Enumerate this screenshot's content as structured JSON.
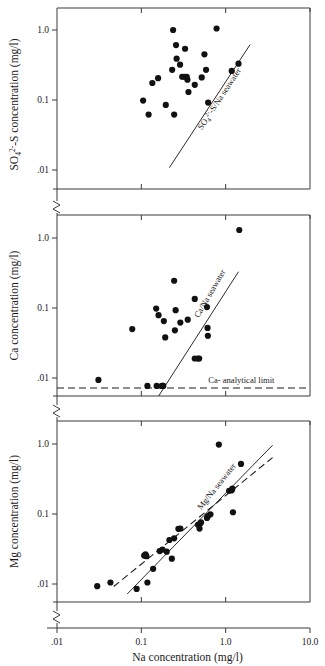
{
  "figure": {
    "xaxis": {
      "label": "Na concentration (mg/l)",
      "ticks": [
        ".01",
        "0.1",
        "1.0",
        "10.0"
      ],
      "tickvalues": [
        0.01,
        0.1,
        1.0,
        10.0
      ],
      "range": [
        0.01,
        10.0
      ],
      "scale": "log"
    },
    "panels": [
      {
        "id": "so4",
        "ylabel": "SO₄²⁻-S concentration (mg/l)",
        "ylabel_parts": {
          "base": "SO",
          "sub": "4",
          "sup": "2-",
          "rest": "-S concentration (mg/l)"
        },
        "yticks": [
          "1.0",
          "0.1",
          ".01"
        ],
        "ytickvalues": [
          1.0,
          0.1,
          0.01
        ],
        "yrange": [
          0.01,
          1.6
        ],
        "axis_break": true,
        "annotations": [
          {
            "text": "SO₄²⁻-S/Na seawater",
            "kind": "reference-line-label",
            "rotated": true
          }
        ]
      },
      {
        "id": "ca",
        "ylabel": "Ca concentration (mg/l)",
        "yticks": [
          "1.0",
          "0.1",
          ".01"
        ],
        "ytickvalues": [
          1.0,
          0.1,
          0.01
        ],
        "yrange": [
          0.006,
          2.2
        ],
        "axis_break": true,
        "annotations": [
          {
            "text": "Ca/Na seawater",
            "kind": "reference-line-label",
            "rotated": true
          },
          {
            "text": "Ca- analytical limit",
            "kind": "dashed-limit-label",
            "rotated": false
          }
        ]
      },
      {
        "id": "mg",
        "ylabel": "Mg concentration (mg/l)",
        "yticks": [
          "1.0",
          "0.1",
          ".01"
        ],
        "ytickvalues": [
          1.0,
          0.1,
          0.01
        ],
        "yrange": [
          0.007,
          2.2
        ],
        "axis_break": true,
        "annotations": [
          {
            "text": "Mg/Na seawater",
            "kind": "reference-line-label",
            "rotated": true
          }
        ]
      }
    ]
  },
  "chart_data": [
    {
      "type": "scatter",
      "id": "so4-vs-na",
      "title": "",
      "xlabel": "Na concentration (mg/l)",
      "ylabel": "SO4(2-)-S concentration (mg/l)",
      "xscale": "log",
      "yscale": "log",
      "xlim": [
        0.01,
        10.0
      ],
      "ylim": [
        0.01,
        1.6
      ],
      "grid": false,
      "legend": false,
      "marker": "filled-circle",
      "points": [
        {
          "x": 0.105,
          "y": 0.098
        },
        {
          "x": 0.122,
          "y": 0.062
        },
        {
          "x": 0.135,
          "y": 0.175
        },
        {
          "x": 0.158,
          "y": 0.205
        },
        {
          "x": 0.195,
          "y": 0.085
        },
        {
          "x": 0.232,
          "y": 0.27
        },
        {
          "x": 0.238,
          "y": 1.0
        },
        {
          "x": 0.245,
          "y": 0.062
        },
        {
          "x": 0.258,
          "y": 0.61
        },
        {
          "x": 0.262,
          "y": 0.39
        },
        {
          "x": 0.288,
          "y": 0.32
        },
        {
          "x": 0.305,
          "y": 0.215
        },
        {
          "x": 0.322,
          "y": 0.215
        },
        {
          "x": 0.33,
          "y": 0.54
        },
        {
          "x": 0.345,
          "y": 0.215
        },
        {
          "x": 0.352,
          "y": 0.195
        },
        {
          "x": 0.362,
          "y": 0.13
        },
        {
          "x": 0.43,
          "y": 0.165
        },
        {
          "x": 0.52,
          "y": 0.21
        },
        {
          "x": 0.56,
          "y": 0.45
        },
        {
          "x": 0.585,
          "y": 0.27
        },
        {
          "x": 0.62,
          "y": 0.092
        },
        {
          "x": 0.78,
          "y": 1.05
        },
        {
          "x": 1.18,
          "y": 0.26
        },
        {
          "x": 1.42,
          "y": 0.33
        }
      ],
      "reference_lines": [
        {
          "name": "SO4(2-)-S/Na seawater",
          "style": "solid",
          "x": [
            0.215,
            1.95
          ],
          "y": [
            0.0108,
            0.62
          ]
        }
      ]
    },
    {
      "type": "scatter",
      "id": "ca-vs-na",
      "title": "",
      "xlabel": "Na concentration (mg/l)",
      "ylabel": "Ca concentration (mg/l)",
      "xscale": "log",
      "yscale": "log",
      "xlim": [
        0.01,
        10.0
      ],
      "ylim": [
        0.006,
        2.2
      ],
      "grid": false,
      "legend": false,
      "marker": "filled-circle",
      "points": [
        {
          "x": 0.031,
          "y": 0.0094
        },
        {
          "x": 0.078,
          "y": 0.05
        },
        {
          "x": 0.118,
          "y": 0.0077
        },
        {
          "x": 0.15,
          "y": 0.098
        },
        {
          "x": 0.152,
          "y": 0.0077
        },
        {
          "x": 0.16,
          "y": 0.079
        },
        {
          "x": 0.175,
          "y": 0.0077
        },
        {
          "x": 0.18,
          "y": 0.0077
        },
        {
          "x": 0.182,
          "y": 0.0077
        },
        {
          "x": 0.185,
          "y": 0.065
        },
        {
          "x": 0.192,
          "y": 0.038
        },
        {
          "x": 0.245,
          "y": 0.245
        },
        {
          "x": 0.25,
          "y": 0.048
        },
        {
          "x": 0.255,
          "y": 0.093
        },
        {
          "x": 0.29,
          "y": 0.062
        },
        {
          "x": 0.355,
          "y": 0.068
        },
        {
          "x": 0.43,
          "y": 0.019
        },
        {
          "x": 0.47,
          "y": 0.019
        },
        {
          "x": 0.485,
          "y": 0.019
        },
        {
          "x": 0.43,
          "y": 0.135
        },
        {
          "x": 0.6,
          "y": 0.103
        },
        {
          "x": 0.61,
          "y": 0.052
        },
        {
          "x": 0.615,
          "y": 0.04
        },
        {
          "x": 1.45,
          "y": 1.3
        }
      ],
      "reference_lines": [
        {
          "name": "Ca/Na seawater",
          "style": "solid",
          "x": [
            0.16,
            1.42
          ],
          "y": [
            0.0055,
            0.33
          ]
        },
        {
          "name": "Ca- analytical limit",
          "style": "dashed",
          "horizontal": true,
          "y": 0.0072
        }
      ]
    },
    {
      "type": "scatter",
      "id": "mg-vs-na",
      "title": "",
      "xlabel": "Na concentration (mg/l)",
      "ylabel": "Mg concentration (mg/l)",
      "xscale": "log",
      "yscale": "log",
      "xlim": [
        0.01,
        10.0
      ],
      "ylim": [
        0.007,
        2.2
      ],
      "grid": false,
      "legend": false,
      "marker": "filled-circle",
      "points": [
        {
          "x": 0.03,
          "y": 0.0093
        },
        {
          "x": 0.043,
          "y": 0.0105
        },
        {
          "x": 0.088,
          "y": 0.0085
        },
        {
          "x": 0.108,
          "y": 0.0255
        },
        {
          "x": 0.112,
          "y": 0.0265
        },
        {
          "x": 0.115,
          "y": 0.025
        },
        {
          "x": 0.118,
          "y": 0.0105
        },
        {
          "x": 0.138,
          "y": 0.0165
        },
        {
          "x": 0.165,
          "y": 0.0295
        },
        {
          "x": 0.178,
          "y": 0.031
        },
        {
          "x": 0.2,
          "y": 0.029
        },
        {
          "x": 0.215,
          "y": 0.0425
        },
        {
          "x": 0.23,
          "y": 0.023
        },
        {
          "x": 0.245,
          "y": 0.045
        },
        {
          "x": 0.275,
          "y": 0.0615
        },
        {
          "x": 0.29,
          "y": 0.062
        },
        {
          "x": 0.47,
          "y": 0.07
        },
        {
          "x": 0.49,
          "y": 0.062
        },
        {
          "x": 0.5,
          "y": 0.073
        },
        {
          "x": 0.51,
          "y": 0.076
        },
        {
          "x": 0.6,
          "y": 0.088
        },
        {
          "x": 0.615,
          "y": 0.093
        },
        {
          "x": 0.66,
          "y": 0.099
        },
        {
          "x": 0.83,
          "y": 0.98
        },
        {
          "x": 1.1,
          "y": 0.215
        },
        {
          "x": 1.18,
          "y": 0.218
        },
        {
          "x": 1.2,
          "y": 0.23
        },
        {
          "x": 1.22,
          "y": 0.106
        },
        {
          "x": 1.52,
          "y": 0.52
        }
      ],
      "reference_lines": [
        {
          "name": "Mg/Na seawater",
          "style": "solid",
          "x": [
            0.068,
            3.6
          ],
          "y": [
            0.0072,
            0.96
          ]
        },
        {
          "name": "Mg/Na seawater (dashed)",
          "style": "dashed",
          "x": [
            0.047,
            3.6
          ],
          "y": [
            0.0092,
            0.64
          ]
        }
      ]
    }
  ]
}
